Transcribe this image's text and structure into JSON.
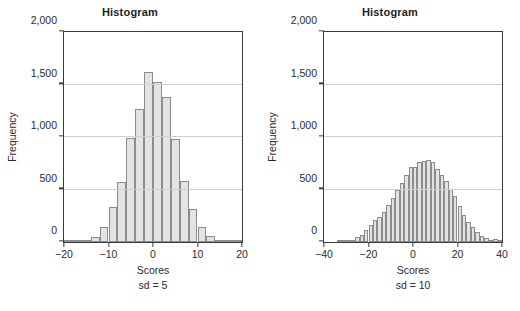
{
  "figure": {
    "background": "#ffffff",
    "bar_fill": "#e3e3e3",
    "bar_stroke": "#8c8c8c",
    "axis_color": "#3a3a3a",
    "grid_color": "#cfcfcf"
  },
  "panels": [
    {
      "id": "left",
      "title": "Histogram",
      "xlabel": "Scores",
      "sublabel": "sd = 5",
      "ylabel": "Frequency"
    },
    {
      "id": "right",
      "title": "Histogram",
      "xlabel": "Scores",
      "sublabel": "sd = 10",
      "ylabel": "Frequency"
    }
  ],
  "chart_data": [
    {
      "type": "bar",
      "title": "Histogram",
      "xlabel": "Scores",
      "ylabel": "Frequency",
      "annotation": "sd = 5",
      "grid": true,
      "grid_axis": "y",
      "legend": "none",
      "xlim": [
        -20,
        20
      ],
      "ylim": [
        0,
        2000
      ],
      "xticks": [
        -20,
        -10,
        0,
        10,
        20
      ],
      "xticklabels": [
        "−20",
        "−10",
        "0",
        "10",
        "20"
      ],
      "yticks": [
        0,
        500,
        1000,
        1500,
        2000
      ],
      "yticklabels": [
        "0",
        "500",
        "1,000",
        "1,500",
        "2,000"
      ],
      "bin_width": 2,
      "bin_starts": [
        -20,
        -18,
        -16,
        -14,
        -12,
        -10,
        -8,
        -6,
        -4,
        -2,
        0,
        2,
        4,
        6,
        8,
        10,
        12,
        14,
        16,
        18
      ],
      "bin_centers": [
        -19,
        -17,
        -15,
        -13,
        -11,
        -9,
        -7,
        -5,
        -3,
        -1,
        1,
        3,
        5,
        7,
        9,
        11,
        13,
        15,
        17,
        19
      ],
      "values": [
        2,
        6,
        22,
        45,
        140,
        335,
        570,
        990,
        1270,
        1620,
        1525,
        1385,
        985,
        585,
        310,
        140,
        55,
        18,
        5,
        2
      ]
    },
    {
      "type": "bar",
      "title": "Histogram",
      "xlabel": "Scores",
      "ylabel": "Frequency",
      "annotation": "sd = 10",
      "grid": true,
      "grid_axis": "y",
      "legend": "none",
      "xlim": [
        -40,
        40
      ],
      "ylim": [
        0,
        2000
      ],
      "xticks": [
        -40,
        -20,
        0,
        20,
        40
      ],
      "xticklabels": [
        "−40",
        "−20",
        "0",
        "20",
        "40"
      ],
      "yticks": [
        0,
        500,
        1000,
        1500,
        2000
      ],
      "yticklabels": [
        "0",
        "500",
        "1,000",
        "1,500",
        "2,000"
      ],
      "bin_width": 2,
      "bin_starts": [
        -40,
        -38,
        -36,
        -34,
        -32,
        -30,
        -28,
        -26,
        -24,
        -22,
        -20,
        -18,
        -16,
        -14,
        -12,
        -10,
        -8,
        -6,
        -4,
        -2,
        0,
        2,
        4,
        6,
        8,
        10,
        12,
        14,
        16,
        18,
        20,
        22,
        24,
        26,
        28,
        30,
        32,
        34,
        36,
        38
      ],
      "bin_centers": [
        -39,
        -37,
        -35,
        -33,
        -31,
        -29,
        -27,
        -25,
        -23,
        -21,
        -19,
        -17,
        -15,
        -13,
        -11,
        -9,
        -7,
        -5,
        -3,
        -1,
        1,
        3,
        5,
        7,
        9,
        11,
        13,
        15,
        17,
        19,
        21,
        23,
        25,
        27,
        29,
        31,
        33,
        35,
        37,
        39
      ],
      "values": [
        0,
        0,
        0,
        2,
        5,
        12,
        22,
        45,
        70,
        115,
        165,
        205,
        240,
        290,
        350,
        420,
        500,
        565,
        635,
        710,
        715,
        760,
        775,
        780,
        760,
        700,
        640,
        580,
        505,
        440,
        340,
        255,
        195,
        140,
        95,
        60,
        40,
        22,
        30,
        8
      ]
    }
  ]
}
